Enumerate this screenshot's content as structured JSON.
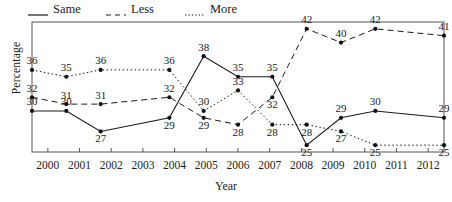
{
  "chart_data": {
    "type": "line",
    "title": "",
    "xlabel": "Year",
    "ylabel": "Percentage",
    "x": [
      2000,
      2001,
      2002,
      2004,
      2005,
      2006,
      2007,
      2008,
      2009,
      2010,
      2012
    ],
    "categories": [
      "2000",
      "2001",
      "2002",
      "2004",
      "2005",
      "2006",
      "2007",
      "2008",
      "2009",
      "2010",
      "2012"
    ],
    "axis_ticks": [
      "2000",
      "2001",
      "2002",
      "2003",
      "2004",
      "2005",
      "2006",
      "2007",
      "2008",
      "2009",
      "2010",
      "2011",
      "2012"
    ],
    "xlim": [
      2000,
      2012
    ],
    "ylim": [
      24,
      43
    ],
    "grid": false,
    "legend_position": "top-left",
    "series": [
      {
        "name": "Same",
        "style": "solid",
        "values": [
          30,
          30,
          27,
          29,
          38,
          35,
          35,
          25,
          29,
          30,
          29
        ]
      },
      {
        "name": "Less",
        "style": "dashed",
        "values": [
          32,
          31,
          31,
          32,
          29,
          28,
          32,
          42,
          40,
          42,
          41
        ]
      },
      {
        "name": "More",
        "style": "dotted",
        "values": [
          36,
          35,
          36,
          36,
          30,
          33,
          28,
          28,
          27,
          25,
          25
        ]
      }
    ]
  },
  "legend": {
    "items": [
      {
        "label": "Same",
        "style": "solid"
      },
      {
        "label": "Less",
        "style": "dashed"
      },
      {
        "label": "More",
        "style": "dotted"
      }
    ]
  },
  "axes": {
    "x_title": "Year",
    "y_title": "Percentage"
  },
  "colors": {
    "line": "#1a1a1a",
    "marker": "#111111",
    "frame": "#555555",
    "text": "#1a1a1a",
    "background": "#ffffff"
  }
}
